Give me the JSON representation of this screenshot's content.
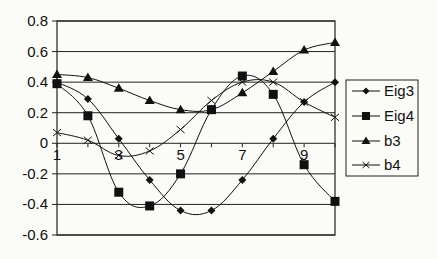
{
  "chart_data": {
    "type": "line",
    "title": "",
    "xlabel": "",
    "ylabel": "",
    "x": [
      1,
      2,
      3,
      4,
      5,
      6,
      7,
      8,
      9,
      10
    ],
    "x_tick_labels": [
      "1",
      "3",
      "5",
      "7",
      "9"
    ],
    "x_tick_values": [
      1,
      3,
      5,
      7,
      9
    ],
    "xlim": [
      1,
      10
    ],
    "ylim": [
      -0.6,
      0.8
    ],
    "y_tick_labels": [
      "0.8",
      "0.6",
      "0.4",
      "0.2",
      "0",
      "-0.2",
      "-0.4",
      "-0.6"
    ],
    "y_tick_values": [
      0.8,
      0.6,
      0.4,
      0.2,
      0,
      -0.2,
      -0.4,
      -0.6
    ],
    "grid": "horizontal",
    "legend_position": "right",
    "series": [
      {
        "name": "Eig3",
        "marker": "diamond",
        "color": "#111111",
        "values": [
          0.4,
          0.29,
          0.03,
          -0.24,
          -0.44,
          -0.44,
          -0.24,
          0.03,
          0.27,
          0.4
        ]
      },
      {
        "name": "Eig4",
        "marker": "square",
        "color": "#111111",
        "values": [
          0.39,
          0.18,
          -0.32,
          -0.41,
          -0.2,
          0.22,
          0.44,
          0.32,
          -0.14,
          -0.38
        ]
      },
      {
        "name": "b3",
        "marker": "triangle",
        "color": "#111111",
        "values": [
          0.45,
          0.43,
          0.36,
          0.28,
          0.22,
          0.22,
          0.33,
          0.47,
          0.61,
          0.66
        ]
      },
      {
        "name": "b4",
        "marker": "x",
        "color": "#111111",
        "values": [
          0.07,
          0.02,
          -0.08,
          -0.05,
          0.09,
          0.28,
          0.4,
          0.4,
          0.27,
          0.17
        ]
      }
    ]
  },
  "legend": {
    "items": [
      {
        "label": "Eig3",
        "marker": "diamond-icon"
      },
      {
        "label": "Eig4",
        "marker": "square-icon"
      },
      {
        "label": "b3",
        "marker": "triangle-icon"
      },
      {
        "label": "b4",
        "marker": "x-icon"
      }
    ]
  }
}
